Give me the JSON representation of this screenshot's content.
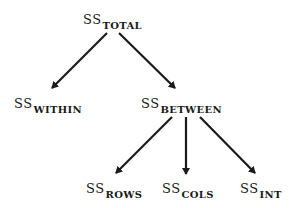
{
  "diagram": {
    "type": "tree",
    "nodes": [
      {
        "id": "total",
        "prefix": "SS",
        "subscript": "TOTAL",
        "x": 83,
        "y": 11
      },
      {
        "id": "within",
        "prefix": "SS",
        "subscript": "WITHIN",
        "x": 14,
        "y": 95
      },
      {
        "id": "between",
        "prefix": "SS",
        "subscript": "BETWEEN",
        "x": 141,
        "y": 95
      },
      {
        "id": "rows",
        "prefix": "SS",
        "subscript": "ROWS",
        "x": 86,
        "y": 180
      },
      {
        "id": "cols",
        "prefix": "SS",
        "subscript": "COLS",
        "x": 162,
        "y": 180
      },
      {
        "id": "int",
        "prefix": "SS",
        "subscript": "INT",
        "x": 240,
        "y": 180
      }
    ],
    "edges": [
      {
        "from": "total",
        "to": "within"
      },
      {
        "from": "total",
        "to": "between"
      },
      {
        "from": "between",
        "to": "rows"
      },
      {
        "from": "between",
        "to": "cols"
      },
      {
        "from": "between",
        "to": "int"
      }
    ],
    "colors": {
      "line": "#1a1a1a",
      "background": "#ffffff"
    }
  }
}
